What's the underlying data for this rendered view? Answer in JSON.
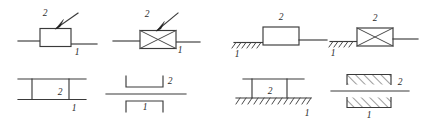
{
  "figure": {
    "background_color": "#ffffff",
    "line_color": "#3a3a3a",
    "label_color": "#2b2b2b",
    "width": 424,
    "height": 124,
    "columns": 4,
    "rows": 2
  },
  "symbols": [
    {
      "id": "sym-1",
      "name": "slider-plain-with-arrow",
      "description": "Plain rectangular block on a horizontal guide line with a diagonal arrow pointing to the block",
      "row": 1,
      "column": 1,
      "features": [
        "horizontal-guide-line",
        "plain-rectangle",
        "diagonal-arrow"
      ],
      "labels": {
        "upper": "2",
        "lower": "1"
      }
    },
    {
      "id": "sym-2",
      "name": "slider-crossed-with-arrow",
      "description": "Rectangular block with internal diagonal cross on a horizontal guide line with a diagonal arrow",
      "row": 1,
      "column": 2,
      "features": [
        "horizontal-guide-line",
        "crossed-rectangle",
        "diagonal-arrow"
      ],
      "labels": {
        "upper": "2",
        "lower": "1"
      }
    },
    {
      "id": "sym-3",
      "name": "slider-plain-grounded",
      "description": "Plain rectangular block attached to a hatched fixed-ground support on its left side",
      "row": 1,
      "column": 3,
      "features": [
        "ground-hatching",
        "plain-rectangle",
        "output-line"
      ],
      "labels": {
        "upper": "2",
        "lower": "1"
      }
    },
    {
      "id": "sym-4",
      "name": "slider-crossed-grounded",
      "description": "Crossed rectangular block attached to a hatched fixed-ground support on its left side",
      "row": 1,
      "column": 4,
      "features": [
        "ground-hatching",
        "crossed-rectangle",
        "output-line"
      ],
      "labels": {
        "upper": "2",
        "lower": "1"
      }
    },
    {
      "id": "sym-5",
      "name": "prismatic-pair-open-rails",
      "description": "Two long parallel horizontal rails joined by two short vertical members forming an open slider box",
      "row": 2,
      "column": 1,
      "features": [
        "upper-rail",
        "lower-rail",
        "two-verticals"
      ],
      "labels": {
        "inner": "2",
        "lower": "1"
      }
    },
    {
      "id": "sym-6",
      "name": "prismatic-pair-brackets",
      "description": "Upward-opening bracket above and downward-opening bracket below a long horizontal sliding bar",
      "row": 2,
      "column": 2,
      "features": [
        "upper-bracket",
        "center-bar",
        "lower-bracket"
      ],
      "labels": {
        "upper": "2",
        "lower": "1"
      }
    },
    {
      "id": "sym-7",
      "name": "prismatic-pair-grounded-rails",
      "description": "Horizontal rail with two vertical members resting on a long hatched fixed-ground line",
      "row": 2,
      "column": 3,
      "features": [
        "upper-rail",
        "two-verticals",
        "ground-hatching"
      ],
      "labels": {
        "inner": "2",
        "lower": "1"
      }
    },
    {
      "id": "sym-8",
      "name": "prismatic-pair-hatched-jaws",
      "description": "Two hatched fixed jaws above and below a long horizontal sliding bar",
      "row": 2,
      "column": 4,
      "features": [
        "upper-hatched-jaw",
        "center-bar",
        "lower-hatched-jaw"
      ],
      "labels": {
        "upper": "2",
        "lower": "1"
      }
    }
  ],
  "labels": {
    "link_two": "2",
    "link_one": "1"
  }
}
